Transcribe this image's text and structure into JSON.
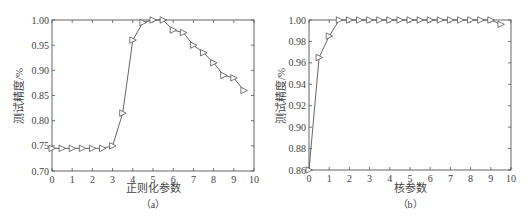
{
  "chart_data": [
    {
      "type": "line",
      "panel": "a",
      "caption": "（a）",
      "title": "",
      "xlabel": "正则化参数",
      "ylabel": "测试精度/%",
      "xlim": [
        0,
        10
      ],
      "ylim": [
        0.7,
        1.0
      ],
      "xticks": [
        "0",
        "1",
        "2",
        "3",
        "4",
        "5",
        "6",
        "7",
        "8",
        "9",
        "10"
      ],
      "yticks": [
        "0.70",
        "0.75",
        "0.80",
        "0.85",
        "0.90",
        "0.95",
        "1.00"
      ],
      "grid": false,
      "marker": "triangle-right",
      "series": [
        {
          "name": "测试精度",
          "x": [
            0,
            0.5,
            1,
            1.5,
            2,
            2.5,
            3,
            3.5,
            4,
            4.5,
            5,
            5.5,
            6,
            6.5,
            7,
            7.5,
            8,
            8.5,
            9,
            9.5
          ],
          "values": [
            0.745,
            0.745,
            0.745,
            0.745,
            0.745,
            0.745,
            0.75,
            0.815,
            0.96,
            0.995,
            1.0,
            1.0,
            0.98,
            0.975,
            0.95,
            0.935,
            0.915,
            0.89,
            0.885,
            0.86
          ]
        }
      ]
    },
    {
      "type": "line",
      "panel": "b",
      "caption": "（b）",
      "title": "",
      "xlabel": "核参数",
      "ylabel": "测试精度/%",
      "xlim": [
        0,
        10
      ],
      "ylim": [
        0.86,
        1.0
      ],
      "xticks": [
        "0",
        "1",
        "2",
        "3",
        "4",
        "5",
        "6",
        "7",
        "8",
        "9",
        "10"
      ],
      "yticks": [
        "0.86",
        "0.88",
        "0.90",
        "0.92",
        "0.94",
        "0.96",
        "0.98",
        "1.00"
      ],
      "grid": false,
      "marker": "triangle-right",
      "series": [
        {
          "name": "测试精度",
          "x": [
            0,
            0.5,
            1,
            1.5,
            2,
            2.5,
            3,
            3.5,
            4,
            4.5,
            5,
            5.5,
            6,
            6.5,
            7,
            7.5,
            8,
            8.5,
            9,
            9.5
          ],
          "values": [
            0.86,
            0.965,
            0.985,
            1.0,
            1.0,
            1.0,
            1.0,
            1.0,
            1.0,
            1.0,
            1.0,
            1.0,
            1.0,
            1.0,
            1.0,
            1.0,
            1.0,
            1.0,
            1.0,
            0.996
          ]
        }
      ]
    }
  ]
}
